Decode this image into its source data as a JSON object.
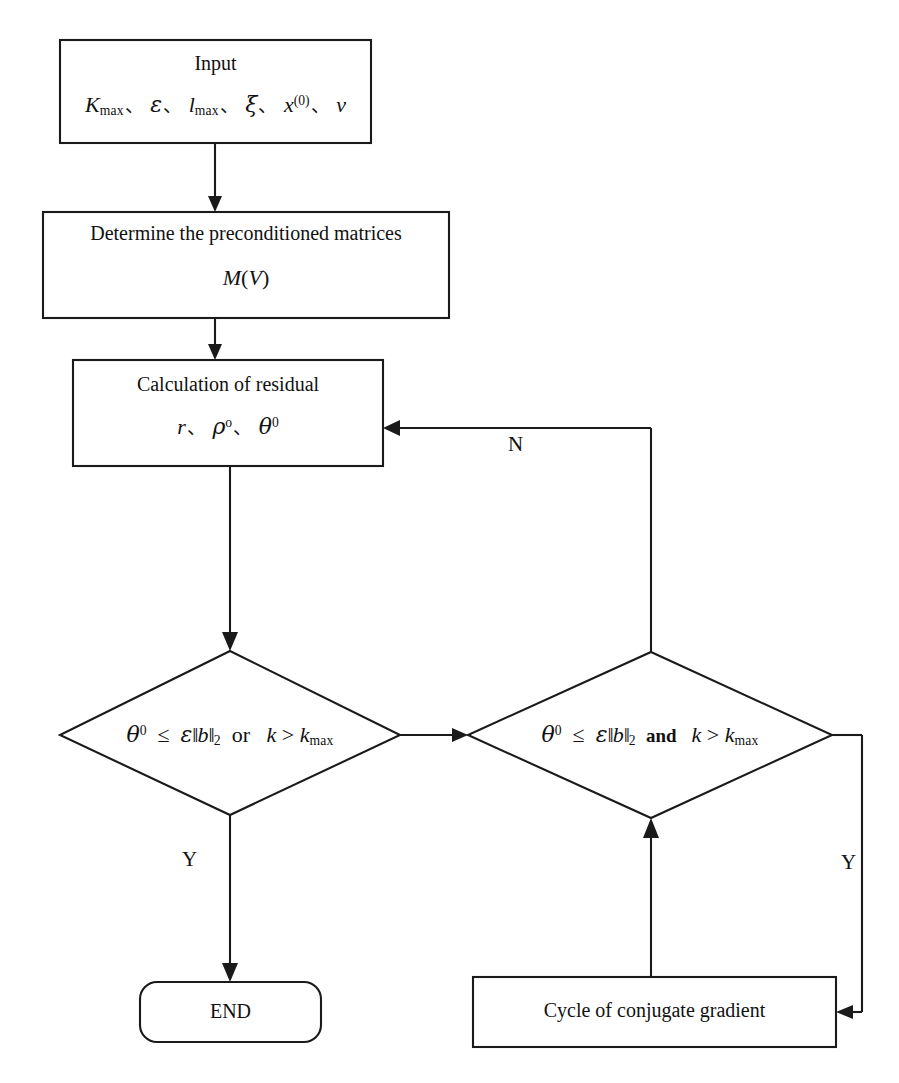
{
  "diagram": {
    "type": "flowchart",
    "background_color": "#ffffff",
    "line_color": "#1a1a1a",
    "nodes": [
      {
        "id": "input",
        "shape": "rectangle",
        "title": "Input",
        "formula_plain": "K_max、ε、l_max、ξ、x^(0)、v"
      },
      {
        "id": "preconditioner",
        "shape": "rectangle",
        "title": "Determine the preconditioned matrices",
        "formula_plain": "M(V)"
      },
      {
        "id": "residual",
        "shape": "rectangle",
        "title": "Calculation of residual",
        "formula_plain": "r、ρ°、θ⁰"
      },
      {
        "id": "decision-or",
        "shape": "diamond",
        "condition_plain": "θ⁰ ≤ ε‖b‖₂ or k > k_max",
        "connector": "or"
      },
      {
        "id": "decision-and",
        "shape": "diamond",
        "condition_plain": "θ⁰ ≤ ε‖b‖₂ and k > k_max",
        "connector": "and"
      },
      {
        "id": "end",
        "shape": "rounded-rectangle",
        "title": "END"
      },
      {
        "id": "cycle",
        "shape": "rectangle",
        "title": "Cycle of conjugate gradient"
      }
    ],
    "edge_labels": {
      "no_branch": "N",
      "yes_left": "Y",
      "yes_right": "Y"
    }
  }
}
